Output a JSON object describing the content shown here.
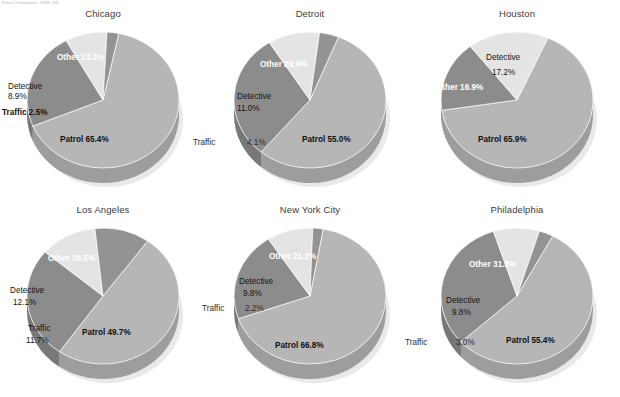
{
  "source_note": "Police Foundation, 1999; 337",
  "colors": {
    "patrol": "#b6b6b6",
    "other": "#8c8c8c",
    "detective": "#e4e4e4",
    "traffic": "#939393",
    "rim": "#cfcfcf",
    "background": "#ffffff",
    "title": "#3c3c3c"
  },
  "chart_data": {
    "type": "pie",
    "title": "",
    "legend_position": "none",
    "grid": false,
    "categories": [
      "Patrol",
      "Other",
      "Detective",
      "Traffic"
    ],
    "unit": "%",
    "charts": [
      {
        "title": "Chicago",
        "slices": [
          {
            "label": "Patrol",
            "value": 65.4,
            "text": "Patrol 65.4%"
          },
          {
            "label": "Other",
            "value": 23.2,
            "text": "Other 23.2%"
          },
          {
            "label": "Detective",
            "value": 8.9,
            "text": "Detective",
            "text2": "8.9%"
          },
          {
            "label": "Traffic",
            "value": 2.5,
            "text": "Traffic 2.5%"
          }
        ]
      },
      {
        "title": "Detroit",
        "slices": [
          {
            "label": "Patrol",
            "value": 55.0,
            "text": "Patrol 55.0%"
          },
          {
            "label": "Other",
            "value": 29.9,
            "text": "Other 29.9%"
          },
          {
            "label": "Detective",
            "value": 11.0,
            "text": "Detective",
            "text2": "11.0%"
          },
          {
            "label": "Traffic",
            "value": 4.1,
            "text": "Traffic",
            "text2": "4.1%"
          }
        ]
      },
      {
        "title": "Houston",
        "slices": [
          {
            "label": "Patrol",
            "value": 65.9,
            "text": "Patrol 65.9%"
          },
          {
            "label": "Other",
            "value": 16.9,
            "text": "Other 16.9%"
          },
          {
            "label": "Detective",
            "value": 17.2,
            "text": "Detective",
            "text2": "17.2%"
          },
          {
            "label": "Traffic",
            "value": 0.0,
            "text": "",
            "text2": ""
          }
        ]
      },
      {
        "title": "Los Angeles",
        "slices": [
          {
            "label": "Patrol",
            "value": 49.7,
            "text": "Patrol 49.7%"
          },
          {
            "label": "Other",
            "value": 26.5,
            "text": "Other 26.5%"
          },
          {
            "label": "Detective",
            "value": 12.1,
            "text": "Detective",
            "text2": "12.1%"
          },
          {
            "label": "Traffic",
            "value": 11.7,
            "text": "Traffic",
            "text2": "11.7%"
          }
        ]
      },
      {
        "title": "New York City",
        "slices": [
          {
            "label": "Patrol",
            "value": 66.8,
            "text": "Patrol 66.8%"
          },
          {
            "label": "Other",
            "value": 21.2,
            "text": "Other 21.2%"
          },
          {
            "label": "Detective",
            "value": 9.8,
            "text": "Detective",
            "text2": "9.8%"
          },
          {
            "label": "Traffic",
            "value": 2.2,
            "text": "Traffic",
            "text2": "2.2%"
          }
        ]
      },
      {
        "title": "Philadelphia",
        "slices": [
          {
            "label": "Patrol",
            "value": 55.4,
            "text": "Patrol 55.4%"
          },
          {
            "label": "Other",
            "value": 31.8,
            "text": "Other 31.8%"
          },
          {
            "label": "Detective",
            "value": 9.8,
            "text": "Detective",
            "text2": "9.8%"
          },
          {
            "label": "Traffic",
            "value": 3.0,
            "text": "Traffic",
            "text2": "3.0%"
          }
        ]
      }
    ]
  }
}
